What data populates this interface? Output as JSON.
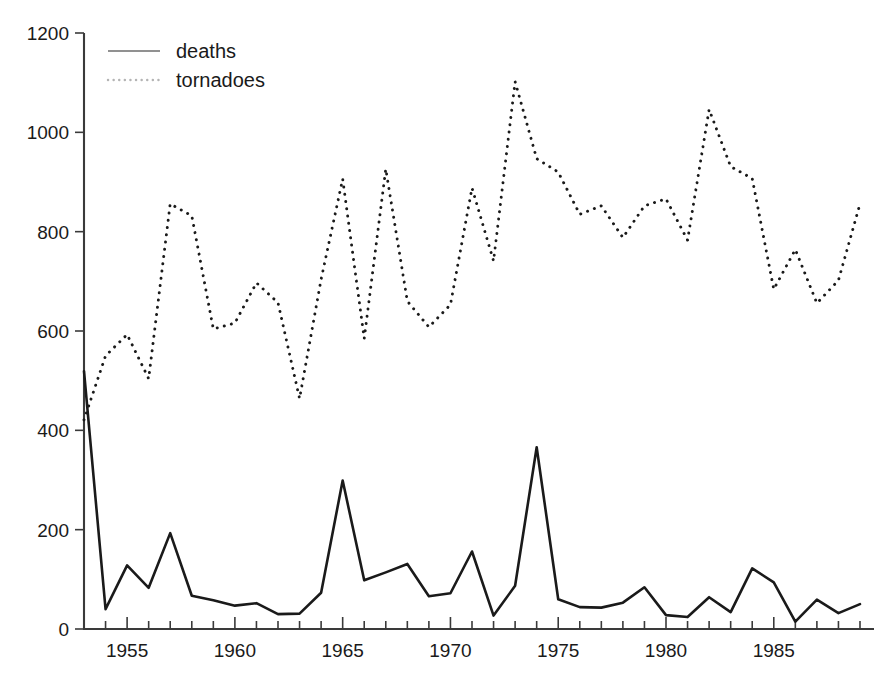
{
  "chart_data": {
    "type": "line",
    "title": "",
    "xlabel": "",
    "ylabel": "",
    "xlim": [
      1953,
      1989
    ],
    "ylim": [
      0,
      1200
    ],
    "grid": false,
    "legend_position": "top-left",
    "y_ticks": [
      0,
      200,
      400,
      600,
      800,
      1000,
      1200
    ],
    "y_tick_labels": [
      "0",
      "200",
      "400",
      "600",
      "800",
      "1000",
      "1200"
    ],
    "x_ticks_major": [
      1955,
      1960,
      1965,
      1970,
      1975,
      1980,
      1985
    ],
    "x_tick_labels": [
      "1955",
      "1960",
      "1965",
      "1970",
      "1975",
      "1980",
      "1985"
    ],
    "x_minor_tick_step": 1,
    "x": [
      1953,
      1954,
      1955,
      1956,
      1957,
      1958,
      1959,
      1960,
      1961,
      1962,
      1963,
      1964,
      1965,
      1966,
      1967,
      1968,
      1969,
      1970,
      1971,
      1972,
      1973,
      1974,
      1975,
      1976,
      1977,
      1978,
      1979,
      1980,
      1981,
      1982,
      1983,
      1984,
      1985,
      1986,
      1987,
      1988,
      1989
    ],
    "series": [
      {
        "name": "deaths",
        "style": "solid",
        "color": "#1a1a1a",
        "values": [
          519,
          40,
          128,
          83,
          193,
          67,
          58,
          47,
          52,
          30,
          31,
          73,
          299,
          98,
          114,
          131,
          66,
          72,
          156,
          27,
          87,
          366,
          60,
          44,
          43,
          53,
          84,
          28,
          24,
          64,
          34,
          122,
          94,
          15,
          59,
          32,
          50
        ]
      },
      {
        "name": "tornadoes",
        "style": "dotted",
        "color": "#1a1a1a",
        "values": [
          421,
          550,
          593,
          504,
          856,
          832,
          604,
          616,
          697,
          657,
          464,
          704,
          906,
          585,
          926,
          660,
          608,
          653,
          888,
          741,
          1102,
          947,
          920,
          835,
          852,
          788,
          852,
          866,
          783,
          1046,
          931,
          907,
          684,
          764,
          656,
          702,
          856
        ]
      }
    ],
    "legend": [
      {
        "label": "deaths",
        "style": "solid"
      },
      {
        "label": "tornadoes",
        "style": "dotted"
      }
    ]
  },
  "colors": {
    "background": "#ffffff",
    "ink": "#1a1a1a",
    "axis": "#3a3a3a"
  }
}
